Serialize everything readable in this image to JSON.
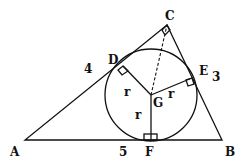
{
  "diagram": {
    "type": "right triangle with inscribed circle",
    "vertices": {
      "A": "A",
      "B": "B",
      "C": "C"
    },
    "tangent_points": {
      "D": "D",
      "E": "E",
      "F": "F"
    },
    "center": "G",
    "radius_labels": {
      "GD": "r",
      "GE": "r",
      "GF": "r"
    },
    "side_labels": {
      "AC": "4",
      "BC": "3",
      "AB": "5"
    },
    "right_angle_at": [
      "C",
      "D",
      "E",
      "F"
    ],
    "dashed_segment": "CG"
  }
}
